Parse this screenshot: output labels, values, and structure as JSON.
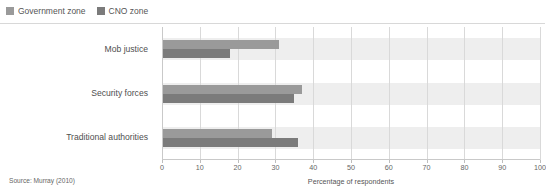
{
  "legend": {
    "position": "top-left",
    "entries": [
      {
        "label": "Government zone",
        "color": "#9a9a9a",
        "swatch_name": "legend-swatch-government-zone"
      },
      {
        "label": "CNO zone",
        "color": "#7b7b7b",
        "swatch_name": "legend-swatch-cno-zone"
      }
    ]
  },
  "footer": {
    "source": "Source: Murray (2010)",
    "x_axis_title": "Percentage of respondents"
  },
  "chart_data": {
    "type": "bar",
    "orientation": "horizontal",
    "title": "",
    "subtitle": "",
    "xlabel": "Percentage of respondents",
    "ylabel": "",
    "categories": [
      "Mob justice",
      "Security forces",
      "Traditional authorities"
    ],
    "series": [
      {
        "name": "Government zone",
        "color": "#9a9a9a",
        "values": [
          31,
          37,
          29
        ]
      },
      {
        "name": "CNO zone",
        "color": "#7b7b7b",
        "values": [
          18,
          35,
          36
        ]
      }
    ],
    "xlim": [
      0,
      100
    ],
    "xticks": [
      0,
      10,
      20,
      30,
      40,
      50,
      60,
      70,
      80,
      90,
      100
    ],
    "xtick_labels": [
      "0",
      "10",
      "20",
      "30",
      "40",
      "50",
      "60",
      "70",
      "80",
      "90",
      "100"
    ],
    "grid": "vertical",
    "band_color": "#eeeeee",
    "gridline_color": "#d9d9d9",
    "legend_position": "top-left"
  }
}
